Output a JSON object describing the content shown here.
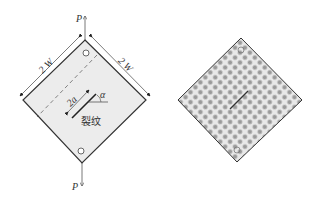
{
  "figure": {
    "left_panel": {
      "description": "Diamond-shaped plate specimen with central inclined crack under tensile load P",
      "load_top_label": "P",
      "load_bottom_label": "P",
      "side_label_left": "2 W",
      "side_label_right": "2 W",
      "crack_length_label": "2a",
      "angle_label": "α",
      "crack_label": "裂纹",
      "colors": {
        "fill": "#ececec",
        "stroke": "#333333"
      }
    },
    "right_panel": {
      "description": "Finite element / particle discretization of the diamond plate with crack",
      "colors": {
        "fill": "#e4e4e4",
        "dot": "#9a9a9a",
        "stroke": "#333333"
      }
    }
  }
}
